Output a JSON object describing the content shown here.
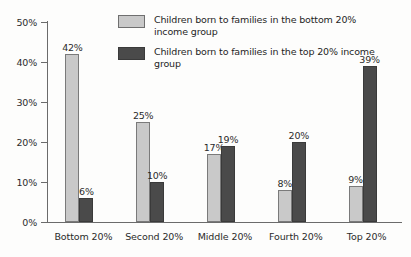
{
  "chart_data": {
    "type": "bar",
    "title": "",
    "subtitle": "",
    "xlabel": "",
    "ylabel": "",
    "ylim": [
      0,
      50
    ],
    "ytick_labels": [
      "0%",
      "10%",
      "20%",
      "30%",
      "40%",
      "50%"
    ],
    "ytick_values": [
      0,
      10,
      20,
      30,
      40,
      50
    ],
    "grid": false,
    "legend_position": "top-center",
    "categories": [
      "Bottom 20%",
      "Second 20%",
      "Middle 20%",
      "Fourth 20%",
      "Top 20%"
    ],
    "series": [
      {
        "name": "Children born to families in the bottom 20% income group",
        "color": "#c9c9c9",
        "values": [
          42,
          25,
          17,
          8,
          9
        ],
        "value_labels": [
          "42%",
          "25%",
          "17%",
          "8%",
          "9%"
        ]
      },
      {
        "name": "Children born to families in the top 20% income group",
        "color": "#4a4a4a",
        "values": [
          6,
          10,
          19,
          20,
          39
        ],
        "value_labels": [
          "6%",
          "10%",
          "19%",
          "20%",
          "39%"
        ]
      }
    ]
  },
  "legend": {
    "items": [
      {
        "swatch": "light-gray-swatch",
        "label": "Children born to families in the bottom 20% income group"
      },
      {
        "swatch": "dark-gray-swatch",
        "label": "Children born to families in the top 20% income group"
      }
    ]
  },
  "axes": {
    "y_labels": [
      "50%",
      "40%",
      "30%",
      "20%",
      "10%",
      "0%"
    ],
    "x_labels": [
      "Bottom 20%",
      "Second 20%",
      "Middle 20%",
      "Fourth 20%",
      "Top 20%"
    ]
  },
  "colors": {
    "series_light": "#c9c9c9",
    "series_dark": "#4a4a4a",
    "axis": "#6b6b6b",
    "text": "#2b2b2b",
    "background": "#fdfdfc"
  }
}
